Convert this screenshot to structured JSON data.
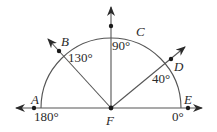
{
  "diagram": {
    "type": "protractor-angle-diagram",
    "center_point": "F",
    "points": [
      {
        "name": "A",
        "angle_deg": 180
      },
      {
        "name": "B",
        "angle_deg": 130
      },
      {
        "name": "C",
        "angle_deg": 90
      },
      {
        "name": "D",
        "angle_deg": 40
      },
      {
        "name": "E",
        "angle_deg": 0
      },
      {
        "name": "F",
        "angle_deg": null
      }
    ],
    "angle_labels": {
      "a180": "180°",
      "a130": "130°",
      "a90": "90°",
      "a40": "40°",
      "a0": "0°"
    },
    "point_labels": {
      "A": "A",
      "B": "B",
      "C": "C",
      "D": "D",
      "E": "E",
      "F": "F"
    },
    "colors": {
      "stroke": "#3a3a3a",
      "text": "#2a2a2a",
      "background": "#ffffff"
    }
  }
}
